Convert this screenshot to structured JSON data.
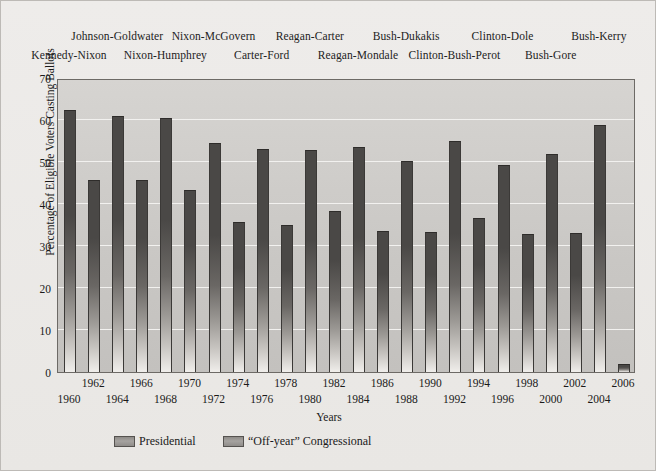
{
  "chart_data": {
    "type": "bar",
    "title": "",
    "xlabel": "Years",
    "ylabel": "Percentage of Eligible Voters Casting Ballots",
    "ylim": [
      0,
      70
    ],
    "ytick_step": 10,
    "yticks": [
      "0",
      "10",
      "20",
      "30",
      "40",
      "50",
      "60",
      "70"
    ],
    "grid": true,
    "legend_position": "bottom-left",
    "categories": [
      "1960",
      "1962",
      "1964",
      "1966",
      "1968",
      "1970",
      "1972",
      "1974",
      "1976",
      "1978",
      "1980",
      "1982",
      "1984",
      "1986",
      "1988",
      "1990",
      "1992",
      "1994",
      "1996",
      "1998",
      "2000",
      "2002",
      "2004",
      "2006"
    ],
    "values": [
      62.4,
      45.6,
      61.0,
      45.8,
      60.4,
      43.3,
      54.5,
      35.7,
      53.2,
      35.0,
      52.8,
      38.4,
      53.5,
      33.6,
      50.3,
      33.3,
      55.1,
      36.7,
      49.4,
      32.8,
      51.8,
      33.0,
      58.9,
      2.0
    ],
    "series_kind": [
      "presidential",
      "off-year",
      "presidential",
      "off-year",
      "presidential",
      "off-year",
      "presidential",
      "off-year",
      "presidential",
      "off-year",
      "presidential",
      "off-year",
      "presidential",
      "off-year",
      "presidential",
      "off-year",
      "presidential",
      "off-year",
      "presidential",
      "off-year",
      "presidential",
      "off-year",
      "presidential",
      "off-year"
    ],
    "legend": [
      {
        "label": "Presidential",
        "color": "#4a4846"
      },
      {
        "label": "“Off-year” Congressional",
        "color": "#4a4846"
      }
    ],
    "annotations_top": [
      {
        "text": "Kennedy-Nixon",
        "year": "1960",
        "row": 1
      },
      {
        "text": "Johnson-Goldwater",
        "year": "1964",
        "row": 0
      },
      {
        "text": "Nixon-Humphrey",
        "year": "1968",
        "row": 1
      },
      {
        "text": "Nixon-McGovern",
        "year": "1972",
        "row": 0
      },
      {
        "text": "Carter-Ford",
        "year": "1976",
        "row": 1
      },
      {
        "text": "Reagan-Carter",
        "year": "1980",
        "row": 0
      },
      {
        "text": "Reagan-Mondale",
        "year": "1984",
        "row": 1
      },
      {
        "text": "Bush-Dukakis",
        "year": "1988",
        "row": 0
      },
      {
        "text": "Clinton-Bush-Perot",
        "year": "1992",
        "row": 1
      },
      {
        "text": "Clinton-Dole",
        "year": "1996",
        "row": 0
      },
      {
        "text": "Bush-Gore",
        "year": "2000",
        "row": 1
      },
      {
        "text": "Bush-Kerry",
        "year": "2004",
        "row": 0
      }
    ],
    "colors": {
      "bar_dark": "#4a4846",
      "plot_background": "#cbc9c6",
      "gridline": "#f2f1ef",
      "figure_background": "#eceae7",
      "axis_line": "#6d6a66",
      "text": "#1a1a1a"
    }
  }
}
